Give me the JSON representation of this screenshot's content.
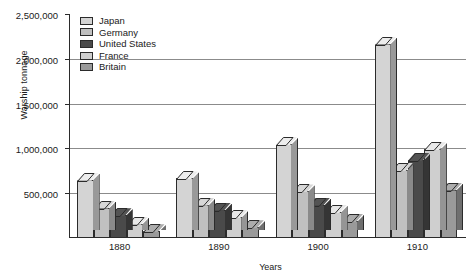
{
  "chart_data": {
    "type": "bar",
    "title": "",
    "xlabel": "Years",
    "ylabel": "Warship tonnage",
    "categories": [
      "1880",
      "1890",
      "1900",
      "1910"
    ],
    "ylim": [
      0,
      2500000
    ],
    "yticks": [
      500000,
      1000000,
      1500000,
      2000000,
      2500000
    ],
    "ytick_labels": [
      "500,000",
      "1,000,000",
      "1,500,000",
      "2,000,000",
      "2,500,000"
    ],
    "grid": true,
    "legend_position": "top-left",
    "style": "3d-grouped-bar",
    "series": [
      {
        "name": "Japan",
        "color": "#d4d4d4",
        "values": [
          650000,
          665000,
          1050000,
          2170000
        ]
      },
      {
        "name": "Germany",
        "color": "#c0c0c0",
        "values": [
          340000,
          370000,
          520000,
          760000
        ]
      },
      {
        "name": "United States",
        "color": "#4a4a4a",
        "values": [
          255000,
          315000,
          370000,
          870000
        ]
      },
      {
        "name": "France",
        "color": "#cfcfcf",
        "values": [
          160000,
          235000,
          290000,
          990000
        ]
      },
      {
        "name": "Britain",
        "color": "#9a9a9a",
        "values": [
          75000,
          120000,
          190000,
          540000
        ]
      }
    ]
  },
  "axes": {
    "y_title": "Warship tonnage",
    "x_title": "Years"
  },
  "legend": {
    "items": [
      {
        "label": "Japan"
      },
      {
        "label": "Germany"
      },
      {
        "label": "United States"
      },
      {
        "label": "France"
      },
      {
        "label": "Britain"
      }
    ]
  }
}
